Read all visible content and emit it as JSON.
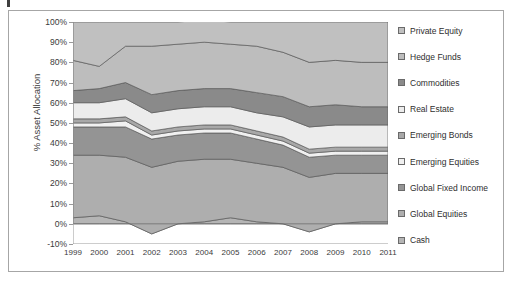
{
  "figure": {
    "ylabel": "% Asset Allocation"
  },
  "legend": {
    "items": [
      {
        "label": "Private Equity",
        "color": "#c0c0c0"
      },
      {
        "label": "Hedge Funds",
        "color": "#bdbdbd"
      },
      {
        "label": "Commodities",
        "color": "#8a8a8a"
      },
      {
        "label": "Real Estate",
        "color": "#ececec"
      },
      {
        "label": "Emerging Bonds",
        "color": "#a8a8a8"
      },
      {
        "label": "Emerging Equities",
        "color": "#f0f0f0"
      },
      {
        "label": "Global Fixed Income",
        "color": "#949494"
      },
      {
        "label": "Global Equities",
        "color": "#aeaeae"
      },
      {
        "label": "Cash",
        "color": "#b5b5b5"
      }
    ]
  },
  "chart_data": {
    "type": "area",
    "stacked": true,
    "title": "",
    "xlabel": "",
    "ylabel": "% Asset Allocation",
    "ylim": [
      -10,
      100
    ],
    "ytick_labels": [
      "100%",
      "90%",
      "80%",
      "70%",
      "60%",
      "50%",
      "40%",
      "30%",
      "20%",
      "10%",
      "0%",
      "-10%"
    ],
    "ytick_values": [
      100,
      90,
      80,
      70,
      60,
      50,
      40,
      30,
      20,
      10,
      0,
      -10
    ],
    "grid": false,
    "legend_position": "right",
    "categories": [
      "1999",
      "2000",
      "2001",
      "2002",
      "2003",
      "2004",
      "2005",
      "2006",
      "2007",
      "2008",
      "2009",
      "2010",
      "2011"
    ],
    "series": [
      {
        "name": "Cash",
        "color": "#b5b5b5",
        "values": [
          3,
          4,
          1,
          -5,
          0,
          1,
          3,
          1,
          0,
          -4,
          0,
          1,
          1
        ]
      },
      {
        "name": "Global Equities",
        "color": "#aeaeae",
        "values": [
          31,
          30,
          32,
          33,
          31,
          31,
          29,
          29,
          28,
          27,
          25,
          24,
          24
        ]
      },
      {
        "name": "Global Fixed Income",
        "color": "#949494",
        "values": [
          14,
          14,
          15,
          14,
          13,
          13,
          13,
          12,
          11,
          10,
          9,
          9,
          9
        ]
      },
      {
        "name": "Emerging Equities",
        "color": "#f0f0f0",
        "values": [
          2,
          2,
          3,
          2,
          2,
          2,
          2,
          2,
          2,
          2,
          2,
          2,
          2
        ]
      },
      {
        "name": "Emerging Bonds",
        "color": "#a8a8a8",
        "values": [
          2,
          2,
          2,
          2,
          2,
          2,
          2,
          2,
          2,
          2,
          2,
          2,
          2
        ]
      },
      {
        "name": "Real Estate",
        "color": "#ececec",
        "values": [
          8,
          8,
          9,
          9,
          9,
          9,
          9,
          9,
          10,
          11,
          11,
          11,
          11
        ]
      },
      {
        "name": "Commodities",
        "color": "#8a8a8a",
        "values": [
          6,
          7,
          8,
          9,
          9,
          9,
          9,
          10,
          10,
          10,
          10,
          9,
          9
        ]
      },
      {
        "name": "Hedge Funds",
        "color": "#bdbdbd",
        "values": [
          15,
          11,
          18,
          24,
          23,
          23,
          22,
          23,
          22,
          22,
          22,
          22,
          22
        ]
      },
      {
        "name": "Private Equity",
        "color": "#c0c0c0",
        "values": [
          19,
          22,
          12,
          12,
          11,
          11,
          11,
          12,
          15,
          20,
          19,
          20,
          20
        ]
      }
    ]
  }
}
